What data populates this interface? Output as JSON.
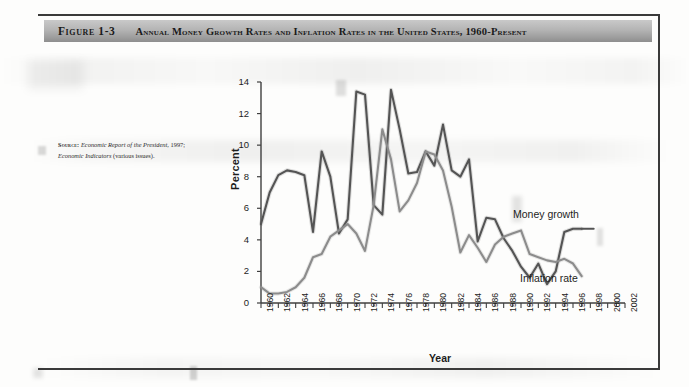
{
  "figure": {
    "number": "Figure 1-3",
    "caption": "Annual Money Growth Rates and Inflation Rates in the United States, 1960-Present",
    "source_label": "Source:",
    "source_line1_italic": "Economic Report of the President,",
    "source_line1_rest": " 1997;",
    "source_line2_italic": "Economic Indicators",
    "source_line2_rest": " (various issues)."
  },
  "chart_data": {
    "type": "line",
    "title": "Annual Money Growth Rates and Inflation Rates in the United States, 1960-Present",
    "xlabel": "Year",
    "ylabel": "Percent",
    "xlim": [
      1960,
      2002
    ],
    "ylim": [
      0,
      14
    ],
    "ytick_step": 2,
    "xtick_step": 2,
    "grid": false,
    "legend_position": "inline-right",
    "yticks": [
      "0",
      "2",
      "4",
      "6",
      "8",
      "10",
      "12",
      "14"
    ],
    "xticks": [
      "1960",
      "1962",
      "1964",
      "1966",
      "1968",
      "1970",
      "1972",
      "1974",
      "1976",
      "1978",
      "1980",
      "1982",
      "1984",
      "1986",
      "1988",
      "1990",
      "1992",
      "1994",
      "1996",
      "1998",
      "2000",
      "2002"
    ],
    "x": [
      1960,
      1961,
      1962,
      1963,
      1964,
      1965,
      1966,
      1967,
      1968,
      1969,
      1970,
      1971,
      1972,
      1973,
      1974,
      1975,
      1976,
      1977,
      1978,
      1979,
      1980,
      1981,
      1982,
      1983,
      1984,
      1985,
      1986,
      1987,
      1988,
      1989,
      1990,
      1991,
      1992,
      1993,
      1994,
      1995,
      1996,
      1997
    ],
    "series": [
      {
        "name": "Money growth",
        "color": "#545454",
        "values": [
          5.0,
          7.0,
          8.1,
          8.4,
          8.3,
          8.1,
          4.5,
          9.6,
          8.0,
          4.4,
          5.3,
          13.4,
          13.2,
          6.2,
          5.6,
          13.5,
          11.0,
          8.2,
          8.3,
          9.6,
          8.7,
          11.3,
          8.4,
          8.0,
          9.1,
          3.9,
          5.4,
          5.3,
          4.1,
          3.3,
          2.3,
          1.6,
          2.5,
          1.2,
          2.0,
          4.5,
          4.7,
          4.7
        ]
      },
      {
        "name": "Inflation rate",
        "color": "#8c8c8c",
        "values": [
          1.0,
          0.6,
          0.6,
          0.7,
          1.0,
          1.6,
          2.9,
          3.1,
          4.2,
          4.6,
          5.0,
          4.4,
          3.3,
          6.2,
          11.0,
          9.1,
          5.8,
          6.5,
          7.6,
          9.6,
          9.4,
          8.4,
          6.1,
          3.2,
          4.3,
          3.5,
          2.6,
          3.7,
          4.2,
          4.4,
          4.6,
          3.1,
          2.9,
          2.7,
          2.6,
          2.8,
          2.5,
          1.7
        ]
      }
    ]
  }
}
